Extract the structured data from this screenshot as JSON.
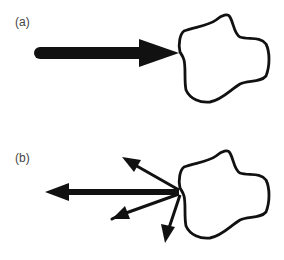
{
  "panels": [
    {
      "id": "a",
      "label": "(a)",
      "description": "Single large force arrow pushing into an irregular closed body",
      "arrows": [
        {
          "name": "incoming-force-arrow",
          "direction": "right",
          "weight": "heavy"
        }
      ]
    },
    {
      "id": "b",
      "label": "(b)",
      "description": "Multiple force arrows radiating outward from a contact point on an irregular closed body",
      "arrows": [
        {
          "name": "left-force-arrow",
          "direction": "left",
          "weight": "heavy"
        },
        {
          "name": "up-left-force-arrow",
          "direction": "up-left",
          "weight": "light"
        },
        {
          "name": "down-left-force-arrow",
          "direction": "down-left",
          "weight": "light"
        },
        {
          "name": "down-force-arrow",
          "direction": "down",
          "weight": "light"
        }
      ]
    }
  ],
  "colors": {
    "stroke": "#111111",
    "label": "#444444",
    "background": "#ffffff"
  }
}
